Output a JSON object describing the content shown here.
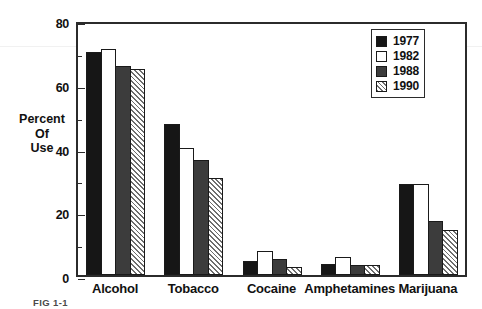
{
  "chart_data": {
    "type": "bar",
    "title": "",
    "xlabel": "",
    "ylabel": "Percent Of Use",
    "ylabel_lines": [
      "Percent",
      "Of",
      "Use"
    ],
    "ylim": [
      0,
      80
    ],
    "yticks": [
      0,
      20,
      40,
      60,
      80
    ],
    "ytick_labels": [
      "0",
      "20",
      "40",
      "60",
      "80"
    ],
    "yminor_ticks": [
      10,
      30,
      50,
      70
    ],
    "grid": false,
    "legend_position": "top-right",
    "categories": [
      "Alcohol",
      "Tobacco",
      "Cocaine",
      "Amphetamines",
      "Marijuana"
    ],
    "series": [
      {
        "name": "1977",
        "color": "#161616",
        "fill": "solid-black",
        "values": [
          70.0,
          47.5,
          4.5,
          3.5,
          28.5
        ]
      },
      {
        "name": "1982",
        "color": "#ffffff",
        "fill": "solid-white",
        "values": [
          71.0,
          40.0,
          7.5,
          5.5,
          28.5
        ]
      },
      {
        "name": "1988",
        "color": "#3c3c3c",
        "fill": "solid-gray",
        "values": [
          65.5,
          36.0,
          5.0,
          3.0,
          17.0
        ]
      },
      {
        "name": "1990",
        "color": "#6e6e6e",
        "fill": "diagonal-hatch",
        "values": [
          64.5,
          30.5,
          2.5,
          3.0,
          14.0
        ]
      }
    ]
  },
  "legend": {
    "entries": [
      {
        "label": "1977"
      },
      {
        "label": "1982"
      },
      {
        "label": "1988"
      },
      {
        "label": "1990"
      }
    ]
  },
  "caption": {
    "text": "FIG 1-1"
  }
}
